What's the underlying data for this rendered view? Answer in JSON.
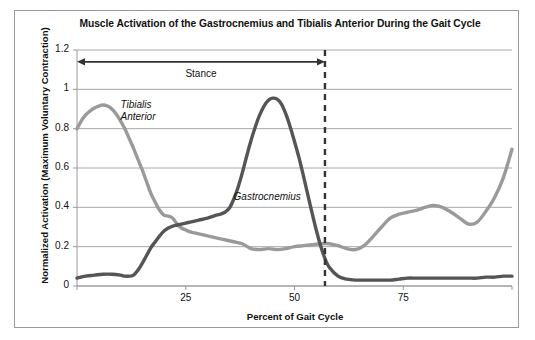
{
  "chart_data": {
    "type": "line",
    "title": "Muscle Activation of the Gastrocnemius and Tibialis Anterior During the Gait Cycle",
    "xlabel": "Percent of Gait Cycle",
    "ylabel": "Normalized Activation (Maximum Voluntary Contraction)",
    "xlim": [
      0,
      100
    ],
    "ylim": [
      0,
      1.2
    ],
    "xticks": [
      25,
      50,
      75
    ],
    "xtick_labels": [
      "25",
      "50",
      "75"
    ],
    "yticks": [
      0,
      0.2,
      0.4,
      0.6,
      0.8,
      1,
      1.2
    ],
    "ytick_labels": [
      "0",
      "0.2",
      "0.4",
      "0.6",
      "0.8",
      "1",
      "1.2"
    ],
    "grid": "horizontal",
    "legend_position": "inline-annotations",
    "annotations": [
      {
        "name": "stance-phase-span",
        "text": "Stance",
        "type": "double-arrow",
        "x_start": 0,
        "x_end": 57,
        "y": 1.14
      },
      {
        "name": "toe-off-marker",
        "text": "",
        "type": "dashed-vertical-line",
        "x": 57,
        "y_start": 0,
        "y_end": 1.2
      }
    ],
    "series": [
      {
        "name": "Tibialis Anterior",
        "color": "#9a9a9a",
        "label_x": 10,
        "label_y": 0.92,
        "x": [
          0,
          1,
          2,
          3,
          4,
          5,
          6,
          7,
          8,
          9,
          10,
          11,
          12,
          13,
          14,
          15,
          16,
          17,
          18,
          19,
          20,
          21,
          22,
          23,
          24,
          25,
          26,
          27,
          28,
          30,
          32,
          34,
          36,
          38,
          40,
          42,
          44,
          46,
          48,
          50,
          52,
          54,
          56,
          58,
          60,
          62,
          64,
          66,
          68,
          70,
          72,
          74,
          76,
          78,
          80,
          82,
          84,
          86,
          88,
          90,
          92,
          94,
          96,
          98,
          100
        ],
        "values": [
          0.8,
          0.84,
          0.87,
          0.89,
          0.905,
          0.915,
          0.92,
          0.915,
          0.9,
          0.875,
          0.84,
          0.8,
          0.75,
          0.7,
          0.645,
          0.59,
          0.53,
          0.47,
          0.425,
          0.385,
          0.36,
          0.355,
          0.345,
          0.315,
          0.295,
          0.285,
          0.275,
          0.27,
          0.265,
          0.255,
          0.245,
          0.235,
          0.225,
          0.215,
          0.19,
          0.185,
          0.19,
          0.185,
          0.19,
          0.2,
          0.205,
          0.21,
          0.215,
          0.215,
          0.205,
          0.19,
          0.185,
          0.205,
          0.25,
          0.3,
          0.345,
          0.365,
          0.375,
          0.385,
          0.4,
          0.41,
          0.4,
          0.375,
          0.345,
          0.315,
          0.325,
          0.38,
          0.45,
          0.55,
          0.695
        ]
      },
      {
        "name": "Gastrocnemius",
        "color": "#555555",
        "label_x": 36,
        "label_y": 0.45,
        "x": [
          0,
          2,
          4,
          6,
          8,
          10,
          11,
          12,
          13,
          14,
          15,
          16,
          17,
          18,
          19,
          20,
          21,
          22,
          23,
          24,
          25,
          26,
          28,
          30,
          32,
          33,
          34,
          35,
          36,
          37,
          38,
          39,
          40,
          41,
          42,
          43,
          44,
          45,
          46,
          47,
          48,
          49,
          50,
          51,
          52,
          53,
          54,
          55,
          56,
          57,
          58,
          60,
          62,
          64,
          66,
          68,
          70,
          72,
          74,
          76,
          78,
          80,
          82,
          84,
          86,
          88,
          90,
          92,
          94,
          96,
          98,
          100
        ],
        "values": [
          0.04,
          0.05,
          0.055,
          0.06,
          0.06,
          0.055,
          0.05,
          0.05,
          0.055,
          0.08,
          0.115,
          0.155,
          0.195,
          0.225,
          0.255,
          0.28,
          0.295,
          0.305,
          0.31,
          0.315,
          0.32,
          0.325,
          0.335,
          0.345,
          0.36,
          0.365,
          0.375,
          0.395,
          0.44,
          0.5,
          0.575,
          0.66,
          0.74,
          0.81,
          0.87,
          0.915,
          0.945,
          0.955,
          0.95,
          0.925,
          0.875,
          0.81,
          0.735,
          0.655,
          0.565,
          0.47,
          0.375,
          0.285,
          0.205,
          0.14,
          0.095,
          0.05,
          0.035,
          0.03,
          0.03,
          0.03,
          0.03,
          0.03,
          0.035,
          0.04,
          0.04,
          0.04,
          0.04,
          0.04,
          0.04,
          0.04,
          0.04,
          0.04,
          0.045,
          0.045,
          0.05,
          0.05
        ]
      }
    ]
  }
}
